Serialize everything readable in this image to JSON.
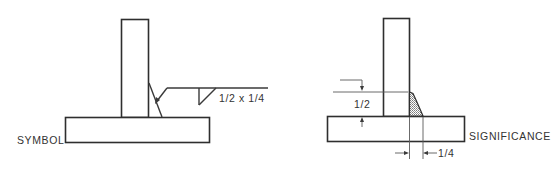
{
  "figure": {
    "left_panel": {
      "caption": "SYMBOL",
      "weld_callout": "1/2 x 1/4"
    },
    "right_panel": {
      "caption": "SIGNIFICANCE",
      "vertical_dimension": "1/2",
      "horizontal_dimension": "1/4"
    }
  },
  "colors": {
    "line": "#3a3a3a",
    "background": "#ffffff",
    "hatch": "#8a8a8a"
  }
}
